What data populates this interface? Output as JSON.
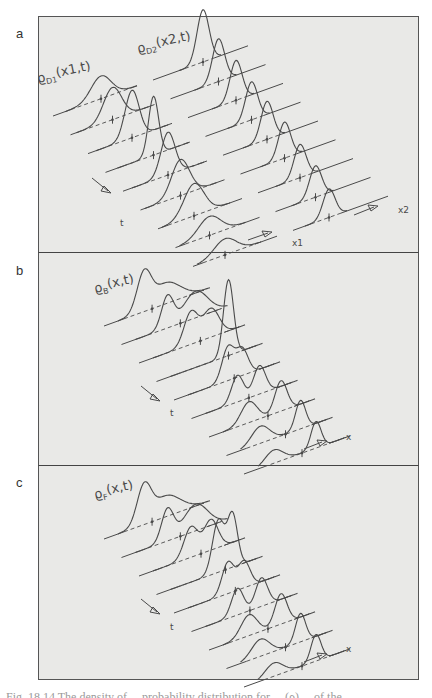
{
  "figure": {
    "caption_partial": "Fig. 18.14  The density of ... probability distribution for ... (ρ) ... of the ...",
    "colors": {
      "background": "#e9e9e7",
      "frame": "#555555",
      "ink": "#4a4a4a"
    }
  },
  "panels": [
    {
      "id": "a",
      "label": "a",
      "curve_labels": [
        {
          "text": "ϱD1(x1,t)",
          "main": "ϱ",
          "sub": "D1",
          "args": "(x1,t)",
          "x": 38,
          "y": 83
        },
        {
          "text": "ϱD2(x2,t)",
          "main": "ϱ",
          "sub": "D2",
          "args": "(x2,t)",
          "x": 138,
          "y": 53
        }
      ],
      "axis_labels": [
        {
          "text": "x1",
          "x": 292,
          "y": 246
        },
        {
          "text": "x2",
          "x": 398,
          "y": 213
        },
        {
          "text": "t",
          "x": 120,
          "y": 226
        }
      ]
    },
    {
      "id": "b",
      "label": "b",
      "curve_labels": [
        {
          "text": "ϱB(x,t)",
          "main": "ϱ",
          "sub": "B",
          "args": "(x,t)",
          "x": 95,
          "y": 293
        }
      ],
      "axis_labels": [
        {
          "text": "x",
          "x": 346,
          "y": 440
        },
        {
          "text": "t",
          "x": 170,
          "y": 416
        }
      ]
    },
    {
      "id": "c",
      "label": "c",
      "curve_labels": [
        {
          "text": "ϱF(x,t)",
          "main": "ϱ",
          "sub": "F",
          "args": "(x,t)",
          "x": 95,
          "y": 499
        }
      ],
      "axis_labels": [
        {
          "text": "x",
          "x": 346,
          "y": 652
        },
        {
          "text": "t",
          "x": 170,
          "y": 630
        }
      ]
    }
  ],
  "chart_data": [
    {
      "type": "line",
      "title": "a: ϱD1(x1,t) and ϱD2(x2,t) — two separated wave packets, waterfall over time",
      "xlabel": "x1, x2",
      "ylabel": "ϱD(x,t)",
      "time_axis": "t (arrow down-right)",
      "slices": 9,
      "series": [
        {
          "name": "ϱD1(x1,t)",
          "peak_height": [
            0.35,
            0.45,
            0.65,
            1.0,
            0.7,
            0.55,
            0.45,
            0.3,
            0.3
          ],
          "peak_position": "moves right then back, spreading"
        },
        {
          "name": "ϱD2(x2,t)",
          "peak_height": [
            0.85,
            0.7,
            0.6,
            0.55,
            0.55,
            0.5,
            0.5,
            0.45,
            0.4
          ],
          "peak_position": "steady near right end"
        }
      ]
    },
    {
      "type": "line",
      "title": "b: ϱB(x,t) — Bose-symmetric density, waterfall over time",
      "xlabel": "x",
      "ylabel": "ϱB(x,t)",
      "time_axis": "t (arrow down-right)",
      "slices": 9,
      "series": [
        {
          "name": "ϱB(x,t)",
          "description": "double-peaked profile; peaks merge into a tall central peak mid-sequence then separate again"
        }
      ]
    },
    {
      "type": "line",
      "title": "c: ϱF(x,t) — Fermi-antisymmetric density, waterfall over time",
      "xlabel": "x",
      "ylabel": "ϱF(x,t)",
      "time_axis": "t (arrow down-right)",
      "slices": 9,
      "series": [
        {
          "name": "ϱF(x,t)",
          "description": "double-peaked profile with a dip (node) in the overlap region mid-sequence"
        }
      ]
    }
  ],
  "geometry": {
    "a": {
      "x0": 53,
      "y0": 116,
      "dx": 17.5,
      "dy": 18.8,
      "len": 84,
      "slope": -0.36,
      "gap_len": 100,
      "right_len": 95,
      "d1": [
        [
          48,
          0.24,
          10
        ],
        [
          42,
          0.34,
          9
        ],
        [
          44,
          0.5,
          7
        ],
        [
          48,
          0.62,
          5
        ],
        [
          45,
          0.45,
          7
        ],
        [
          40,
          0.38,
          9
        ],
        [
          36,
          0.34,
          10
        ],
        [
          34,
          0.2,
          11
        ],
        [
          32,
          0.17,
          11
        ]
      ],
      "d2": [
        [
          150,
          0.55,
          6
        ],
        [
          148,
          0.45,
          6
        ],
        [
          148,
          0.42,
          6
        ],
        [
          146,
          0.4,
          6
        ],
        [
          144,
          0.4,
          6
        ],
        [
          144,
          0.38,
          6
        ],
        [
          142,
          0.35,
          6
        ],
        [
          140,
          0.33,
          6
        ],
        [
          136,
          0.3,
          6
        ]
      ]
    },
    "b": {
      "x0": 104,
      "y0": 326,
      "dx": 17.5,
      "dy": 18.5,
      "len": 185,
      "slope": -0.36,
      "slices": [
        [
          [
            40,
            0.38,
            7
          ],
          [
            62,
            0.22,
            14
          ]
        ],
        [
          [
            46,
            0.33,
            6
          ],
          [
            74,
            0.28,
            12
          ]
        ],
        [
          [
            52,
            0.34,
            7
          ],
          [
            72,
            0.3,
            8
          ]
        ],
        [
          [
            72,
            0.8,
            5
          ]
        ],
        [
          [
            54,
            0.35,
            6
          ],
          [
            68,
            0.28,
            6
          ]
        ],
        [
          [
            46,
            0.28,
            6
          ],
          [
            68,
            0.3,
            6
          ]
        ],
        [
          [
            40,
            0.22,
            8
          ],
          [
            72,
            0.32,
            6
          ]
        ],
        [
          [
            34,
            0.18,
            9
          ],
          [
            74,
            0.3,
            5
          ]
        ],
        [
          [
            30,
            0.14,
            9
          ],
          [
            72,
            0.28,
            5
          ]
        ]
      ]
    },
    "c": {
      "x0": 104,
      "y0": 539,
      "dx": 17.5,
      "dy": 18.5,
      "len": 185,
      "slope": -0.36,
      "slices": [
        [
          [
            40,
            0.38,
            7
          ],
          [
            62,
            0.22,
            14
          ]
        ],
        [
          [
            46,
            0.33,
            6
          ],
          [
            74,
            0.28,
            12
          ]
        ],
        [
          [
            52,
            0.32,
            7
          ],
          [
            72,
            0.32,
            7
          ]
        ],
        [
          [
            62,
            0.55,
            6
          ],
          [
            76,
            0.55,
            5
          ]
        ],
        [
          [
            54,
            0.33,
            6
          ],
          [
            70,
            0.28,
            6
          ]
        ],
        [
          [
            46,
            0.28,
            6
          ],
          [
            70,
            0.3,
            6
          ]
        ],
        [
          [
            40,
            0.22,
            8
          ],
          [
            72,
            0.32,
            6
          ]
        ],
        [
          [
            34,
            0.18,
            9
          ],
          [
            74,
            0.3,
            5
          ]
        ],
        [
          [
            30,
            0.14,
            9
          ],
          [
            72,
            0.28,
            5
          ]
        ]
      ]
    }
  }
}
